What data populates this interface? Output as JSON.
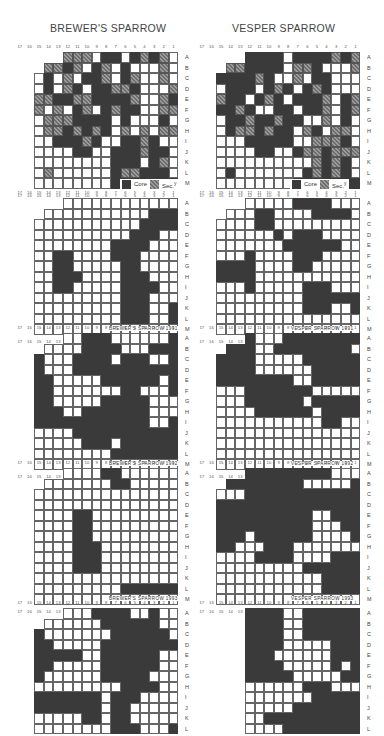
{
  "titles": {
    "left": "BREWER'S SPARROW",
    "right": "VESPER SPARROW"
  },
  "column_numbers": [
    "17",
    "16",
    "15",
    "14",
    "13",
    "12",
    "11",
    "10",
    "9",
    "8",
    "7",
    "6",
    "5",
    "4",
    "3",
    "2",
    "1"
  ],
  "row_letters": [
    "A",
    "B",
    "C",
    "D",
    "E",
    "F",
    "G",
    "H",
    "I",
    "J",
    "K",
    "L",
    "M"
  ],
  "legend": {
    "core_label": "Core",
    "sec_label": "Sec.",
    "sec_superscript": "y"
  },
  "colors": {
    "core": "#3a3a3a",
    "secondary": "#8a8a8a",
    "grid_line": "#666666",
    "background": "#ffffff"
  },
  "panels": [
    {
      "id": "brewers-composite",
      "caption": "",
      "legend": true,
      "rows": [
        "     SSS.XX.XSXS..",
        "   SSXS.XS.X...S..",
        "  .X.S.XXS.XS..S.S",
        "  .X.SX.XXSSX...SS",
        "  SSXXSSXXXXS..SX.",
        "  S.S.XS.XSXX..SS.",
        "  .SSSXXXX.X...X.S",
        "  .SSXSXSX.S.S.SS.",
        "  ..XXXSX..XXSX..X",
        "  ....XX..XXXSXX.X",
        "  ........XXX.XS.X",
        "  .S......XSSXXX.X",
        "  ........XXXXXXXX"
      ]
    },
    {
      "id": "vesper-composite",
      "caption": "",
      "legend": true,
      "rows": [
        "     XXXX.XXXXSXSS",
        "   SSXXXX.SSX...S.",
        "  XXXXSX..S.XX....",
        "  .XXX.XSX.XSX...X",
        "  SXX.XSX.XXXS.XS.",
        "  XXSX..XX.XXS.XS.",
        "  .XXSXXSXX..S.X..",
        "  .XSSXSXX.SX.SS..",
        "  ...XXXXX..SSSX.X",
        "  ....XX..XSSXSSSS",
        "  ..........SXSX.XX",
        "  .X.......XSXSX.SS",
        "  ........XXXXXXXX"
      ]
    },
    {
      "id": "brewers-1991",
      "caption": "BREWER'S SPARROW 1991",
      "legend": false,
      "rows": [
        "     ...........",
        "   ...........XXX..",
        "  ...........XXXX..",
        "  ..........XXX.....",
        "  ........XXXX....X",
        "  ..XX....XXX.....X",
        "  ..XX.....XX......",
        "  ..XXX....XXX.....",
        "  ..XX.....XXXX....",
        "  .........XXX.....",
        "  .........XXX..XX.",
        "  .........XXX..XXX",
        "  ................."
      ]
    },
    {
      "id": "vesper-1991",
      "caption": "VESPER SPARROW 1991",
      "legend": false,
      "rows": [
        "     .....XXXX....",
        "   ...XX....XXXX..",
        "  ....XX.........",
        "  ......X.XXX......",
        "  .......XXXXXX....",
        "  ...X....XXX......",
        "  XXXX....XX.......",
        "  XXXX.............",
        "  ...X.....XXX.....",
        "  .........XXXXXXX.",
        "  .........XXX..XXX",
        "  ...............X",
        "  ................."
      ]
    },
    {
      "id": "brewers-1992",
      "caption": "BREWER'S SPARROW 1992",
      "legend": false,
      "rows": [
        "     ..XXX......X",
        "   ....XXXX...XXX",
        "  X...XXXX.XXX..XXX",
        "  X...XXXXXXXXXXXXX",
        "  XX.....XXXXXX.XXX",
        "  XX.......XX...XX",
        "  XX.....XXXXX...XX",
        "  XXX..XXXXXXX....X",
        "  XXXXXXXXXXXX..XXX",
        "  ....XXXXXXXXXXXXX",
        "  .....XXX.XXXXXXXX",
        "  ........XXXXXXXXX",
        "  ................."
      ]
    },
    {
      "id": "vesper-1992",
      "caption": "VESPER SPARROW 1992",
      "legend": false,
      "rows": [
        "     X...XXXXXXXX.",
        "   XXX..XXXXXXXX..X",
        "  XXXX.....XXXXXX..X",
        "  XXXX......XXXXXXX",
        "  XXXXXXXX..XXXXXXX",
        "  ...XXXXXXX.....XXX",
        "  ...XXXXXX.XXXXX..",
        "  ....XXXXXX.XXXX..",
        "  ...........XX....",
        "  .................",
        "  .................",
        "  .................",
        "  ................."
      ]
    },
    {
      "id": "brewers-1993",
      "caption": "BREWER'S SPARROW 1993",
      "legend": false,
      "rows": [
        "     ....XX......",
        "   .......XX......",
        "  .................",
        "  .................",
        "  ....XX..........X",
        "  ....XX...........",
        "  ....XX...........",
        "  ....XXX..........",
        "  ....XXX.........X",
        "  ....XXX.........X",
        "  ................X",
        "  .........XXXXXXXX",
        "  ................."
      ]
    },
    {
      "id": "vesper-1993",
      "caption": "VESPER SPARROW 1993",
      "legend": false,
      "rows": [
        "     XXXXXXXXX.....",
        "   XXXXXXXX.....XXX",
        "  ...XXXXXXXXXXXXX",
        "  XXXXXXXXXXXXXXXXX",
        "  XXXXXXXXXX..XXXXX",
        "  XXXXXXXXXX...XXXX",
        "  XXX.XXXXXX....XXX",
        "  XX...XXX.......XX",
        "  ....XXXX....XXXXX",
        "  .........XXXXXXXX",
        "  ...........XXXXXX",
        "  ...........XXXXXX",
        "  ................."
      ]
    },
    {
      "id": "brewers-1994",
      "caption": "",
      "legend": false,
      "rows": [
        "     ...XXXX..X.",
        "   ......XXXXXX..",
        "  X.......XXXXXX..",
        "  XX.....XXXXXXXX.",
        "  XXXXX..XXXXXX...",
        "  XX.....XXXXXX...",
        "  X......XXXXX....",
        "  .........XXXX....",
        "  XXXXXXX.XXX......",
        "  XXXXXXX.XX.....X.",
        "  .....XX.XX.....XX",
        "  ........XXX...XXX"
      ]
    },
    {
      "id": "vesper-1994",
      "caption": "",
      "legend": false,
      "rows": [
        "     XXXX..XXXXXXXX",
        "     XXXX..XXXXXX..",
        "     XXXX..XXXXXX..",
        "     XXXX.....XXXXX",
        "     XXX......XXXXX",
        "     XXXX.....X.XXX",
        "     XXXXX.....XXXX",
        "     ......XXX......",
        "     .......XXXXXX..",
        "     .....XXXXXXXX.",
        "     ..XXXXXXXXXXX.",
        "     ....XXXXXXXXXXX"
      ]
    }
  ],
  "chart_data": {
    "type": "heatmap",
    "x_ticks": [
      "17",
      "16",
      "15",
      "14",
      "13",
      "12",
      "11",
      "10",
      "9",
      "8",
      "7",
      "6",
      "5",
      "4",
      "3",
      "2",
      "1"
    ],
    "y_ticks": [
      "A",
      "B",
      "C",
      "D",
      "E",
      "F",
      "G",
      "H",
      "I",
      "J",
      "K",
      "L",
      "M"
    ],
    "legend": [
      "Core",
      "Sec."
    ],
    "panels": [
      "Composite",
      "1991",
      "1992",
      "1993",
      "(unlabeled bottom)"
    ],
    "species": [
      "BREWER'S SPARROW",
      "VESPER SPARROW"
    ]
  }
}
